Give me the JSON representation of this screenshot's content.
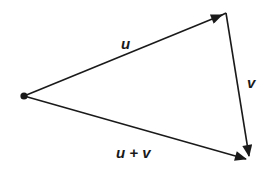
{
  "diagram": {
    "type": "vector-addition-triangle",
    "colors": {
      "stroke": "#1a1a1a",
      "background": "#ffffff"
    },
    "points": {
      "origin": [
        24,
        96
      ],
      "top": [
        226,
        13
      ],
      "bottom_right": [
        250,
        160
      ]
    },
    "vectors": [
      {
        "id": "u",
        "label": "u",
        "from": "origin",
        "to": "top"
      },
      {
        "id": "v",
        "label": "v",
        "from": "top",
        "to": "bottom_right"
      },
      {
        "id": "u_plus_v",
        "label": "u + v",
        "from": "origin",
        "to": "bottom_right"
      }
    ],
    "labels": {
      "u": "u",
      "v": "v",
      "u_plus_v": "u + v"
    }
  }
}
